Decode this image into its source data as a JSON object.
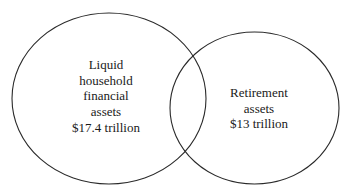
{
  "diagram": {
    "type": "venn",
    "sets": [
      {
        "id": "liquid",
        "lines": [
          "Liquid",
          "household",
          "financial",
          "assets",
          "$17.4 trillion"
        ],
        "value": "$17.4 trillion",
        "stroke": "#2a2a2a"
      },
      {
        "id": "retirement",
        "lines": [
          "Retirement",
          "assets",
          "$13 trillion"
        ],
        "value": "$13 trillion",
        "stroke": "#2a2a2a"
      }
    ],
    "overlap": true
  }
}
